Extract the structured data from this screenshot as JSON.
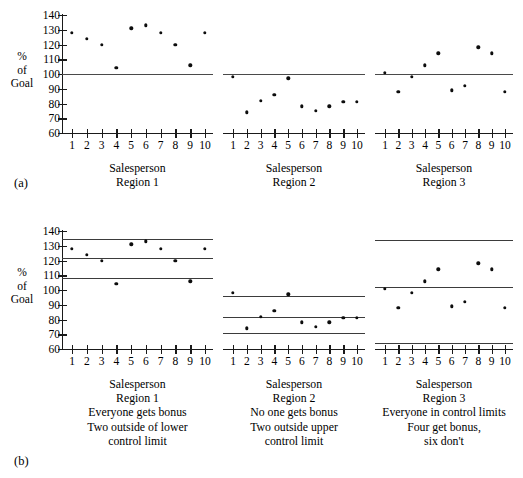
{
  "figure": {
    "panel_a_tag": "(a)",
    "panel_b_tag": "(b)",
    "y_axis_label_lines": [
      "%",
      "of",
      "Goal"
    ],
    "y_ticks": [
      60,
      70,
      80,
      90,
      100,
      110,
      120,
      130,
      140
    ],
    "x_ticks": [
      1,
      2,
      3,
      4,
      5,
      6,
      7,
      8,
      9,
      10
    ],
    "x_axis_title": "Salesperson",
    "footer_partial_text": ""
  },
  "chart_data": {
    "type": "scatter",
    "title": "",
    "xlabel": "Salesperson",
    "ylabel": "% of Goal",
    "ylim": [
      60,
      140
    ],
    "xlim": [
      0.4,
      10.6
    ],
    "grid": false,
    "legend": "none",
    "panels": [
      {
        "tag": "(a)",
        "note": "Goal line only at 100% of Goal",
        "subplots": [
          {
            "name": "Region 1",
            "caption_lines": [
              "Salesperson",
              "Region 1"
            ],
            "x": [
              1,
              2,
              3,
              4,
              5,
              6,
              7,
              8,
              9,
              10
            ],
            "values": [
              128,
              124,
              120,
              104,
              131,
              133,
              128,
              120,
              106,
              128
            ],
            "reference_lines": [
              {
                "label": "Goal",
                "value": 100
              }
            ]
          },
          {
            "name": "Region 2",
            "caption_lines": [
              "Salesperson",
              "Region 2"
            ],
            "x": [
              1,
              2,
              3,
              4,
              5,
              6,
              7,
              8,
              9,
              10
            ],
            "values": [
              98,
              74,
              82,
              86,
              97,
              78,
              75,
              78,
              81,
              81
            ],
            "reference_lines": [
              {
                "label": "Goal",
                "value": 100
              }
            ]
          },
          {
            "name": "Region 3",
            "caption_lines": [
              "Salesperson",
              "Region 3"
            ],
            "x": [
              1,
              2,
              3,
              4,
              5,
              6,
              7,
              8,
              9,
              10
            ],
            "values": [
              101,
              88,
              98,
              106,
              114,
              89,
              92,
              118,
              114,
              88
            ],
            "reference_lines": [
              {
                "label": "Goal",
                "value": 100
              }
            ]
          }
        ]
      },
      {
        "tag": "(b)",
        "note": "Control limits added to each region",
        "subplots": [
          {
            "name": "Region 1",
            "caption_lines": [
              "Salesperson",
              "Region 1",
              "Everyone gets bonus",
              "Two outside of lower",
              "control limit"
            ],
            "x": [
              1,
              2,
              3,
              4,
              5,
              6,
              7,
              8,
              9,
              10
            ],
            "values": [
              128,
              124,
              120,
              104,
              131,
              133,
              128,
              120,
              106,
              128
            ],
            "reference_lines": [
              {
                "label": "UCL",
                "value": 134.5
              },
              {
                "label": "Center",
                "value": 121.5
              },
              {
                "label": "LCL",
                "value": 108
              }
            ]
          },
          {
            "name": "Region 2",
            "caption_lines": [
              "Salesperson",
              "Region 2",
              "No one gets bonus",
              "Two outside upper",
              "control limit"
            ],
            "x": [
              1,
              2,
              3,
              4,
              5,
              6,
              7,
              8,
              9,
              10
            ],
            "values": [
              98,
              74,
              82,
              86,
              97,
              78,
              75,
              78,
              81,
              81
            ],
            "reference_lines": [
              {
                "label": "UCL",
                "value": 96
              },
              {
                "label": "Center",
                "value": 82
              },
              {
                "label": "LCL",
                "value": 71
              }
            ]
          },
          {
            "name": "Region 3",
            "caption_lines": [
              "Salesperson",
              "Region 3",
              "Everyone in control limits",
              "Four get bonus,",
              "six don't"
            ],
            "x": [
              1,
              2,
              3,
              4,
              5,
              6,
              7,
              8,
              9,
              10
            ],
            "values": [
              101,
              88,
              98,
              106,
              114,
              89,
              92,
              118,
              114,
              88
            ],
            "reference_lines": [
              {
                "label": "UCL",
                "value": 134
              },
              {
                "label": "Center",
                "value": 102
              },
              {
                "label": "LCL",
                "value": 64
              }
            ]
          }
        ]
      }
    ]
  }
}
